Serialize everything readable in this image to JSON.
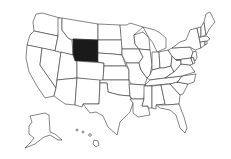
{
  "map": {
    "type": "us-states-choropleth",
    "highlighted_state": "Wyoming",
    "colors": {
      "highlight": "#1a1a1a",
      "default_fill": "#ffffff",
      "border": "#333333",
      "background": "#ffffff"
    },
    "regions_shown": [
      "contiguous-us",
      "alaska-inset",
      "hawaii-inset"
    ]
  }
}
